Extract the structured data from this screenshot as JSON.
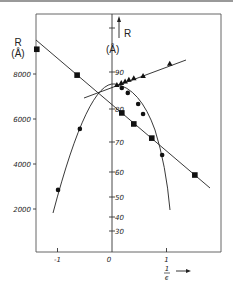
{
  "chart_data": {
    "type": "scatter",
    "title": "",
    "xlabel": "1/ϵ",
    "ylabel_left": "R (Å)",
    "ylabel_right": "R (Å)",
    "x_ticks": [
      -1,
      0,
      1
    ],
    "x_tick_labels": [
      "-1",
      "0",
      "1"
    ],
    "y_left_ticks": [
      2000,
      4000,
      6000,
      8000
    ],
    "y_left_tick_labels": [
      "2000",
      "4000",
      "6000",
      "8000"
    ],
    "y_right_ticks": [
      30,
      40,
      50,
      60,
      70,
      80,
      90
    ],
    "y_right_tick_labels": [
      "30",
      "40",
      "50",
      "60",
      "70",
      "80",
      "90"
    ],
    "xlim": [
      -1.4,
      2.0
    ],
    "ylim_left": [
      0,
      9500
    ],
    "grid": false,
    "legend": "none",
    "series": [
      {
        "name": "squares (left axis)",
        "marker": "square",
        "axis": "left",
        "fit": "linear",
        "points": [
          [
            -1.38,
            9100
          ],
          [
            -0.64,
            7950
          ],
          [
            0.18,
            6270
          ],
          [
            0.4,
            5780
          ],
          [
            0.73,
            5150
          ],
          [
            1.52,
            3510
          ]
        ]
      },
      {
        "name": "circles (left axis)",
        "marker": "circle",
        "axis": "left",
        "fit": "parabola",
        "points": [
          [
            -0.99,
            2850
          ],
          [
            -0.59,
            5560
          ],
          [
            0.18,
            7380
          ],
          [
            0.29,
            7160
          ],
          [
            0.48,
            6670
          ],
          [
            0.57,
            6220
          ],
          [
            0.92,
            4400
          ]
        ]
      },
      {
        "name": "triangles (right axis)",
        "marker": "triangle",
        "axis": "right",
        "fit": "linear",
        "points": [
          [
            0.09,
            86.5
          ],
          [
            0.17,
            87.0
          ],
          [
            0.24,
            87.4
          ],
          [
            0.31,
            87.9
          ],
          [
            0.4,
            88.3
          ],
          [
            0.57,
            88.9
          ],
          [
            1.06,
            92.2
          ]
        ]
      }
    ]
  },
  "labels": {
    "left_axis_title_1": "R",
    "left_axis_title_2": "(Å)",
    "right_axis_title_1": "R",
    "right_axis_title_2": "(Å)",
    "x_axis_num": "1",
    "x_axis_den": "ϵ",
    "x_arrow": "→"
  }
}
